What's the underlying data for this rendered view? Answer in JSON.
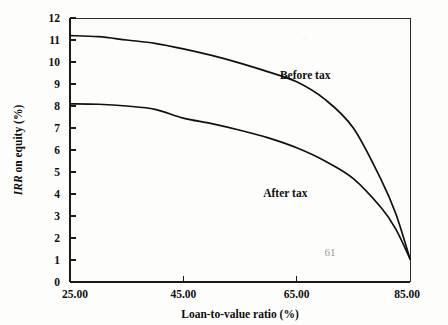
{
  "figure": {
    "background_color": "#fdfdfc",
    "ink_color": "#101010",
    "page_number": "61"
  },
  "chart_data": {
    "type": "line",
    "title": "",
    "xlabel": "Loan-to-value ratio (%)",
    "ylabel": "IRR on equity (%)",
    "ylabel_italic_part": "IRR",
    "ylabel_roman_part": " on equity (%)",
    "xlim": [
      25,
      85
    ],
    "ylim": [
      0,
      12
    ],
    "grid": false,
    "legend_position": "inline-annotations",
    "xticks": [
      25,
      45,
      65,
      85
    ],
    "xtick_labels": [
      "25.00",
      "45.00",
      "65.00",
      "85.00"
    ],
    "yticks": [
      0,
      1,
      2,
      3,
      4,
      5,
      6,
      7,
      8,
      9,
      10,
      11,
      12
    ],
    "ytick_labels": [
      "0",
      "1",
      "2",
      "3",
      "4",
      "5",
      "6",
      "7",
      "8",
      "9",
      "10",
      "11",
      "12"
    ],
    "x": [
      25,
      30,
      35,
      40,
      45,
      50,
      55,
      60,
      65,
      70,
      75,
      80,
      82.5,
      85
    ],
    "series": [
      {
        "name": "Before tax",
        "label": "Before tax",
        "label_x": 66.5,
        "label_y": 9.25,
        "values": [
          11.2,
          11.15,
          11.0,
          10.85,
          10.6,
          10.3,
          9.95,
          9.55,
          9.1,
          8.3,
          7.0,
          4.6,
          3.1,
          1.05
        ]
      },
      {
        "name": "After tax",
        "label": "After tax",
        "label_x": 63.0,
        "label_y": 3.85,
        "values": [
          8.1,
          8.08,
          8.0,
          7.85,
          7.45,
          7.2,
          6.9,
          6.55,
          6.1,
          5.5,
          4.7,
          3.35,
          2.4,
          1.05
        ]
      }
    ]
  }
}
